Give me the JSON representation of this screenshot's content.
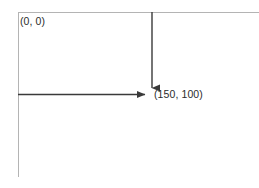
{
  "diagram": {
    "type": "coordinate-offset-diagram",
    "canvas": {
      "width": 259,
      "height": 188,
      "background": "#ffffff"
    },
    "colors": {
      "guide_line": "#b4b4b4",
      "arrow_line": "#3a3a3a",
      "text": "#2b2b2b"
    },
    "guides": {
      "top_edge": {
        "x1": 18,
        "y1": 12,
        "x2": 259,
        "y2": 12,
        "stroke_width": 1
      },
      "left_edge": {
        "x1": 18,
        "y1": 12,
        "x2": 18,
        "y2": 177,
        "stroke_width": 1
      }
    },
    "arrows": [
      {
        "name": "horizontal-offset-arrow",
        "direction": "right",
        "x1": 18,
        "y1": 94,
        "x2": 151,
        "y2": 94,
        "stroke_width": 1.4
      },
      {
        "name": "vertical-offset-arrow",
        "direction": "down",
        "x1": 152,
        "y1": 12,
        "x2": 152,
        "y2": 94,
        "stroke_width": 1.4
      }
    ],
    "labels": {
      "origin": "(0, 0)",
      "point": "(150, 100)"
    }
  }
}
